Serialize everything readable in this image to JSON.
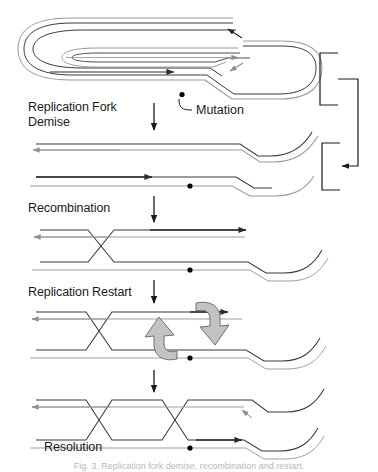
{
  "figure": {
    "width": 378,
    "height": 472,
    "background": "#ffffff",
    "caption": "Fig. 3.  Replication fork demise, recombination and restart."
  },
  "colors": {
    "dark_strand": "#2b2b2b",
    "light_strand": "#9a9a9a",
    "gray_arrow_fill": "#c3c3c3",
    "gray_arrow_stroke": "#6e6e6e",
    "text": "#1a1a1a",
    "mutation_dot": "#000000",
    "bracket": "#4a4a4a"
  },
  "stages": [
    {
      "id": "replication-fork-demise",
      "label": "Replication Fork\nDemise",
      "x": 28,
      "y": 100
    },
    {
      "id": "recombination",
      "label": "Recombination",
      "x": 28,
      "y": 201
    },
    {
      "id": "replication-restart",
      "label": "Replication Restart",
      "x": 28,
      "y": 285
    },
    {
      "id": "resolution",
      "label": "Resolution",
      "x": 44,
      "y": 440
    }
  ],
  "annotations": [
    {
      "id": "mutation",
      "label": "Mutation",
      "x": 196,
      "y": 104,
      "dot_x": 182,
      "dot_y": 95
    }
  ],
  "panels": [
    {
      "id": "theta-structure",
      "name": "circular-replicating-chromosome",
      "description": "Theta-form replicating circular chromosome with replication bubble and fork",
      "arrows": [
        "leading-strand-right",
        "lagging-strand-right",
        "fork-arrow-upper",
        "fork-arrow-lower"
      ],
      "mutation_marks": 1
    },
    {
      "id": "linear-broken-fork",
      "name": "collapsed-fork-duplex",
      "description": "Linearized duplexes after fork collapse, arms curving to the right",
      "arrows": [
        "top-strand-left",
        "bottom-strand-right"
      ],
      "mutation_marks": 1
    },
    {
      "id": "single-crossover",
      "name": "recombination-intermediate",
      "description": "Single strand crossover (Holliday junction) joining the two duplexes",
      "arrows": [
        "top-strand-right",
        "top-light-strand-left"
      ],
      "mutation_marks": 1
    },
    {
      "id": "restart-panel",
      "name": "replication-restart-intermediate",
      "description": "Crossover structure with two gray block arrows indicating branch migration / restart",
      "arrows": [
        "top-strand-right",
        "top-light-strand-left"
      ],
      "gray_block_arrows": 2,
      "mutation_marks": 1
    },
    {
      "id": "resolution-panel",
      "name": "resolved-double-crossover",
      "description": "Double crossover producing a resolved product",
      "arrows": [
        "top-light-strand-left",
        "bottom-strand-right",
        "small-fork-arrow"
      ],
      "mutation_marks": 1
    }
  ],
  "brackets": [
    {
      "id": "bracket-upper",
      "name": "bracket-upper-region",
      "x": 320,
      "y_top": 53,
      "y_bottom": 105
    },
    {
      "id": "bracket-lower",
      "name": "bracket-lower-region",
      "x": 320,
      "y_top": 143,
      "y_bottom": 190
    },
    {
      "id": "bracket-connector",
      "name": "bracket-connector-arrow",
      "direction": "down-then-left",
      "arrow_target": "bracket-lower"
    }
  ]
}
